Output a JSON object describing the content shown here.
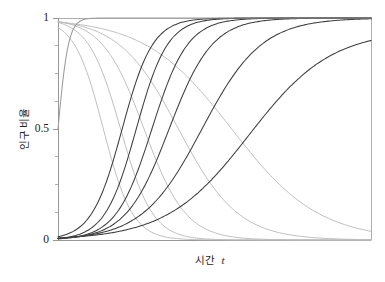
{
  "chart_data": {
    "type": "line",
    "title": "",
    "subtitle": "",
    "xlabel_text": "시간",
    "xlabel_symbol": "t",
    "ylabel": "인구 비율",
    "xlim": [
      0,
      10
    ],
    "ylim": [
      0,
      1
    ],
    "grid": false,
    "legend": "none",
    "x_ticks": [],
    "x_tick_labels": [],
    "y_ticks": [
      0,
      0.5,
      1
    ],
    "y_tick_labels": [
      "0",
      "0.5",
      "1"
    ],
    "y_minor_ticks": [
      0.125,
      0.25,
      0.375,
      0.625,
      0.75,
      0.875
    ],
    "annotations": [],
    "colors": {
      "rising": "#3a3a3a",
      "falling": "#b4b4b4",
      "axis": "#8d8d8d",
      "text": "#232323",
      "background": "#ffffff"
    },
    "series_note": "logistic adoption curves p(t)=1/(1+exp(-k(t-t0))) and their complements 1-p(t)",
    "series": [
      {
        "name": "rising-1",
        "kind": "rising",
        "color": "#3f3f3f",
        "midpoint": 2.05,
        "rate": 2.05,
        "asymptote": 1.0,
        "x": [
          0,
          0.5,
          1,
          1.5,
          2,
          2.5,
          3,
          3.5,
          4,
          5,
          6,
          7,
          8,
          9,
          10
        ],
        "values": [
          0.015,
          0.041,
          0.108,
          0.258,
          0.474,
          0.7,
          0.861,
          0.945,
          0.98,
          0.998,
          1.0,
          1.0,
          1.0,
          1.0,
          1.0
        ]
      },
      {
        "name": "rising-2",
        "kind": "rising",
        "color": "#3f3f3f",
        "midpoint": 2.5,
        "rate": 2.0,
        "asymptote": 1.0,
        "x": [
          0,
          0.5,
          1,
          1.5,
          2,
          2.5,
          3,
          3.5,
          4,
          5,
          6,
          7,
          8,
          9,
          10
        ],
        "values": [
          0.0067,
          0.018,
          0.047,
          0.119,
          0.269,
          0.5,
          0.731,
          0.881,
          0.953,
          0.995,
          0.999,
          1.0,
          1.0,
          1.0,
          1.0
        ]
      },
      {
        "name": "rising-3",
        "kind": "rising",
        "color": "#3f3f3f",
        "midpoint": 3.0,
        "rate": 1.75,
        "asymptote": 1.0,
        "x": [
          0,
          0.5,
          1,
          1.5,
          2,
          2.5,
          3,
          3.5,
          4,
          5,
          6,
          7,
          8,
          9,
          10
        ],
        "values": [
          0.005,
          0.013,
          0.03,
          0.071,
          0.156,
          0.3,
          0.5,
          0.7,
          0.844,
          0.97,
          0.995,
          0.999,
          1.0,
          1.0,
          1.0
        ]
      },
      {
        "name": "rising-4",
        "kind": "rising",
        "color": "#3f3f3f",
        "midpoint": 3.55,
        "rate": 1.45,
        "asymptote": 1.0,
        "x": [
          0,
          0.5,
          1,
          1.5,
          2,
          2.5,
          3,
          3.5,
          4,
          5,
          6,
          7,
          8,
          9,
          10
        ],
        "values": [
          0.006,
          0.012,
          0.025,
          0.05,
          0.1,
          0.189,
          0.326,
          0.5,
          0.674,
          0.9,
          0.975,
          0.994,
          0.999,
          1.0,
          1.0
        ]
      },
      {
        "name": "rising-5",
        "kind": "rising",
        "color": "#3f3f3f",
        "midpoint": 4.6,
        "rate": 1.05,
        "asymptote": 1.0,
        "x": [
          0,
          0.5,
          1,
          1.5,
          2,
          2.5,
          3,
          3.5,
          4,
          5,
          6,
          7,
          8,
          9,
          10
        ],
        "values": [
          0.008,
          0.013,
          0.022,
          0.037,
          0.061,
          0.1,
          0.159,
          0.244,
          0.354,
          0.6,
          0.803,
          0.922,
          0.973,
          0.991,
          0.997
        ]
      },
      {
        "name": "rising-6",
        "kind": "rising",
        "color": "#3f3f3f",
        "midpoint": 6.1,
        "rate": 0.76,
        "asymptote": 0.945,
        "x": [
          0,
          0.5,
          1,
          1.5,
          2,
          2.5,
          3,
          3.5,
          4,
          5,
          6,
          7,
          8,
          9,
          10
        ],
        "values": [
          0.009,
          0.013,
          0.019,
          0.028,
          0.04,
          0.058,
          0.083,
          0.117,
          0.162,
          0.29,
          0.45,
          0.618,
          0.757,
          0.852,
          0.908
        ]
      },
      {
        "name": "falling-1",
        "kind": "falling",
        "color": "#bcbcbc",
        "midpoint": 1.45,
        "rate": 2.15,
        "asymptote": 1.0,
        "x": [
          0,
          0.5,
          1,
          1.5,
          2,
          2.5,
          3,
          3.5,
          4,
          5,
          6,
          7,
          8,
          9,
          10
        ],
        "values": [
          0.957,
          0.886,
          0.724,
          0.5,
          0.276,
          0.123,
          0.048,
          0.018,
          0.006,
          0.001,
          0.0,
          0.0,
          0.0,
          0.0,
          0.0
        ]
      },
      {
        "name": "falling-2",
        "kind": "falling",
        "color": "#bcbcbc",
        "midpoint": 2.0,
        "rate": 1.95,
        "asymptote": 1.0,
        "x": [
          0,
          0.5,
          1,
          1.5,
          2,
          2.5,
          3,
          3.5,
          4,
          5,
          6,
          7,
          8,
          9,
          10
        ],
        "values": [
          0.98,
          0.945,
          0.87,
          0.725,
          0.5,
          0.275,
          0.13,
          0.055,
          0.022,
          0.003,
          0.0,
          0.0,
          0.0,
          0.0,
          0.0
        ]
      },
      {
        "name": "falling-3",
        "kind": "falling",
        "color": "#bcbcbc",
        "midpoint": 2.75,
        "rate": 1.5,
        "asymptote": 1.0,
        "x": [
          0,
          0.5,
          1,
          1.5,
          2,
          2.5,
          3,
          3.5,
          4,
          5,
          6,
          7,
          8,
          9,
          10
        ],
        "values": [
          0.984,
          0.967,
          0.931,
          0.864,
          0.755,
          0.593,
          0.413,
          0.253,
          0.14,
          0.037,
          0.009,
          0.002,
          0.0,
          0.0,
          0.0
        ]
      },
      {
        "name": "falling-4",
        "kind": "falling",
        "color": "#bcbcbc",
        "midpoint": 3.85,
        "rate": 1.05,
        "asymptote": 1.0,
        "x": [
          0,
          0.5,
          1,
          1.5,
          2,
          2.5,
          3,
          3.5,
          4,
          5,
          6,
          7,
          8,
          9,
          10
        ],
        "values": [
          0.983,
          0.971,
          0.951,
          0.919,
          0.868,
          0.795,
          0.7,
          0.59,
          0.47,
          0.256,
          0.113,
          0.043,
          0.015,
          0.005,
          0.002
        ]
      },
      {
        "name": "falling-5",
        "kind": "falling",
        "color": "#bcbcbc",
        "midpoint": 5.55,
        "rate": 0.72,
        "asymptote": 1.0,
        "x": [
          0,
          0.5,
          1,
          1.5,
          2,
          2.5,
          3,
          3.5,
          4,
          5,
          6,
          7,
          8,
          9,
          10
        ],
        "values": [
          0.982,
          0.974,
          0.963,
          0.948,
          0.929,
          0.903,
          0.868,
          0.824,
          0.769,
          0.63,
          0.473,
          0.32,
          0.2,
          0.118,
          0.067
        ]
      },
      {
        "name": "ceiling",
        "kind": "rising",
        "color": "#9c9c9c",
        "midpoint": 0.0,
        "rate": 6.0,
        "asymptote": 1.0,
        "x": [
          0,
          1,
          2,
          4,
          6,
          8,
          10
        ],
        "values": [
          0.998,
          1.0,
          1.0,
          1.0,
          1.0,
          1.0,
          1.0
        ]
      }
    ]
  },
  "figure": {
    "plot_left": 58,
    "plot_right": 371,
    "plot_top": 18,
    "plot_bottom": 240
  }
}
